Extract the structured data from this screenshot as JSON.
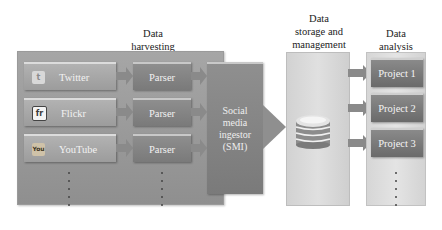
{
  "headings": {
    "harvesting": [
      "Data",
      "harvesting"
    ],
    "storage": [
      "Data",
      "storage and",
      "management"
    ],
    "analysis": [
      "Data",
      "analysis"
    ]
  },
  "sources": [
    {
      "label": "Twitter",
      "icon": "twitter-icon",
      "icon_text": "t"
    },
    {
      "label": "Flickr",
      "icon": "flickr-icon",
      "icon_text": "fr"
    },
    {
      "label": "YouTube",
      "icon": "youtube-icon",
      "icon_text": "You"
    }
  ],
  "parsers": [
    "Parser",
    "Parser",
    "Parser"
  ],
  "ingestor": [
    "Social",
    "media",
    "ingestor",
    "(SMI)"
  ],
  "storage": {
    "icon": "database-icon"
  },
  "projects": [
    "Project 1",
    "Project 2",
    "Project 3"
  ],
  "colors": {
    "harvest_panel": "#9a9a9a",
    "box_dark": "#7a7a7a",
    "box_light": "#a8a8a8",
    "storage_panel": "#d8d8d8",
    "arrow": "#8c8c8c"
  }
}
